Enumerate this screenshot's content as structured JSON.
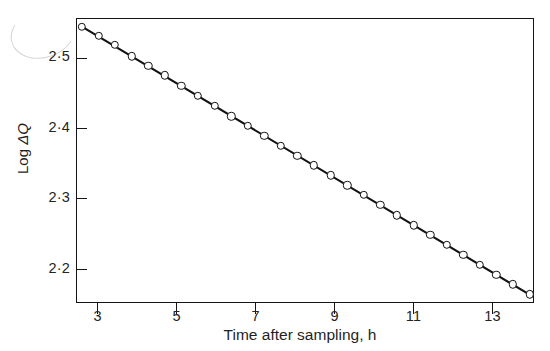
{
  "figure": {
    "style": "scanned-monochrome-scientific-figure",
    "background_color": "#ffffff",
    "ink_color": "#141414"
  },
  "axes": {
    "x": {
      "title": "Time after sampling, h",
      "tick_labels": [
        "3",
        "5",
        "7",
        "9",
        "11",
        "13"
      ],
      "tick_values": [
        3,
        5,
        7,
        9,
        11,
        13
      ],
      "range": [
        2.45,
        14.05
      ]
    },
    "y": {
      "title_prefix": "Log ",
      "title_symbol": "ΔQ",
      "title": "Log ΔQ",
      "tick_labels": [
        "2·5",
        "2·4",
        "2·3",
        "2·2"
      ],
      "tick_values": [
        2.5,
        2.4,
        2.3,
        2.2
      ],
      "range": [
        2.1525,
        2.5575
      ]
    }
  },
  "chart_data": {
    "type": "scatter",
    "title": "",
    "subtitle": "",
    "xlabel": "Time after sampling, h",
    "ylabel": "Log ΔQ",
    "xlim": [
      2.45,
      14.05
    ],
    "ylim": [
      2.1525,
      2.5575
    ],
    "grid": false,
    "legend": null,
    "marker_style": "open-circle",
    "fit_line": {
      "type": "linear",
      "slope": -0.0336,
      "intercept": 2.6327,
      "x_start": 2.6,
      "y_start": 2.5453,
      "x_end": 13.95,
      "y_end": 2.164,
      "equation": "y = 2.6327 - 0.0336x"
    },
    "series": [
      {
        "name": "Log ΔQ vs time",
        "x": [
          2.6,
          3.02,
          3.44,
          3.86,
          4.28,
          4.7,
          5.12,
          5.54,
          5.96,
          6.38,
          6.8,
          7.22,
          7.64,
          8.06,
          8.48,
          8.9,
          9.32,
          9.74,
          10.16,
          10.58,
          11.0,
          11.42,
          11.84,
          12.26,
          12.68,
          13.1,
          13.52,
          13.94
        ],
        "y": [
          2.545,
          2.532,
          2.519,
          2.503,
          2.49,
          2.476,
          2.461,
          2.447,
          2.433,
          2.418,
          2.404,
          2.39,
          2.376,
          2.362,
          2.348,
          2.334,
          2.32,
          2.306,
          2.292,
          2.277,
          2.263,
          2.249,
          2.235,
          2.221,
          2.207,
          2.193,
          2.179,
          2.165
        ]
      }
    ]
  }
}
